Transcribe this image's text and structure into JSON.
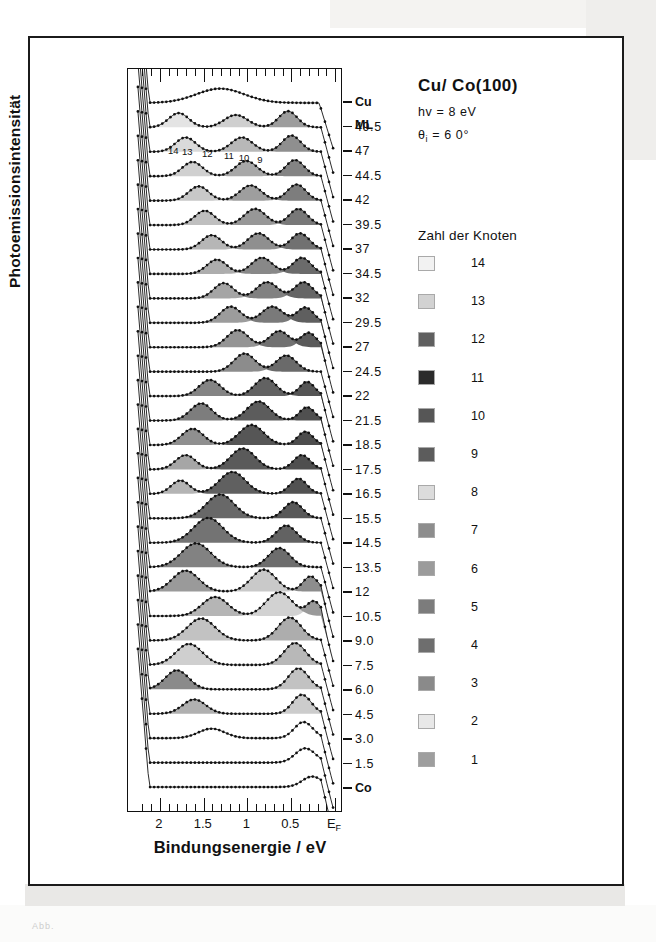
{
  "figure": {
    "header": {
      "title": "Cu/ Co(100)",
      "photon_energy": "hv = 8 eV",
      "angle": "θi = 6 0°",
      "angle_symbol": "θ",
      "angle_sub": "i",
      "angle_value": "= 6 0°"
    },
    "legend": {
      "title": "Zahl der Knoten",
      "entries": [
        {
          "label": "14",
          "color": "#f2f2f2"
        },
        {
          "label": "13",
          "color": "#d2d2d2"
        },
        {
          "label": "12",
          "color": "#5f5f5f"
        },
        {
          "label": "11",
          "color": "#2b2b2b"
        },
        {
          "label": "10",
          "color": "#565656"
        },
        {
          "label": "9",
          "color": "#5c5c5c"
        },
        {
          "label": "8",
          "color": "#dcdcdc"
        },
        {
          "label": "7",
          "color": "#8d8d8d"
        },
        {
          "label": "6",
          "color": "#9b9b9b"
        },
        {
          "label": "5",
          "color": "#7c7c7c"
        },
        {
          "label": "4",
          "color": "#6e6e6e"
        },
        {
          "label": "3",
          "color": "#8a8a8a"
        },
        {
          "label": "2",
          "color": "#e8e8e8"
        },
        {
          "label": "1",
          "color": "#9e9e9e"
        }
      ]
    },
    "axes": {
      "x_caption": "Bindungsenergie / eV",
      "y_caption": "Photoemissionsintensität",
      "x_ticklabels": [
        "2",
        "1.5",
        "1",
        "0.5",
        "E"
      ],
      "x_fermi_sub": "F",
      "x_range_ev": [
        2.25,
        0.0
      ],
      "x_major_ticks_ev": [
        2.0,
        1.5,
        1.0,
        0.5,
        0.0
      ],
      "x_minor_step_ev": 0.1
    },
    "node_annotations": [
      {
        "label": "14",
        "x_ev": 1.84
      },
      {
        "label": "13",
        "x_ev": 1.68
      },
      {
        "label": "12",
        "x_ev": 1.45
      },
      {
        "label": "11",
        "x_ev": 1.2
      },
      {
        "label": "10",
        "x_ev": 1.03
      },
      {
        "label": "9",
        "x_ev": 0.82
      }
    ]
  },
  "chart_data": {
    "type": "line",
    "title": "Cu/ Co(100)",
    "xlabel": "Bindungsenergie / eV",
    "ylabel": "Photoemissionsintensität",
    "xlim": [
      2.25,
      0.0
    ],
    "grid": false,
    "legend_position": "right",
    "x_ticklabels": [
      "2",
      "1.5",
      "1",
      "0.5",
      "EF"
    ],
    "trace_labels_top_to_bottom": [
      "Cu",
      "ML",
      "49.5",
      "47",
      "44.5",
      "42",
      "39.5",
      "37",
      "34.5",
      "32",
      "29.5",
      "27",
      "24.5",
      "22",
      "21.5",
      "18.5",
      "17.5",
      "16.5",
      "15.5",
      "14.5",
      "13.5",
      "12",
      "10.5",
      "9.0",
      "7.5",
      "6.0",
      "4.5",
      "3.0",
      "1.5",
      "Co"
    ],
    "traces": [
      {
        "label": "Cu",
        "coverage_ml": null,
        "bold": true,
        "peaks": [
          {
            "x_ev": 1.3,
            "amp": 0.3,
            "w": 0.62,
            "shade": null
          }
        ],
        "edge_ev": 0.16,
        "plateau": 0.3
      },
      {
        "label": "49.5",
        "coverage_ml": 49.5,
        "peaks": [
          {
            "x_ev": 1.78,
            "amp": 0.3,
            "w": 0.26,
            "shade": "#e4e4e4"
          },
          {
            "x_ev": 1.12,
            "amp": 0.26,
            "w": 0.3,
            "shade": "#cfcfcf"
          },
          {
            "x_ev": 0.52,
            "amp": 0.34,
            "w": 0.24,
            "shade": "#9d9d9d"
          }
        ],
        "edge_ev": 0.14
      },
      {
        "label": "47",
        "coverage_ml": 47,
        "peaks": [
          {
            "x_ev": 1.7,
            "amp": 0.3,
            "w": 0.26,
            "shade": "#dadada"
          },
          {
            "x_ev": 1.05,
            "amp": 0.3,
            "w": 0.28,
            "shade": "#b8b8b8"
          },
          {
            "x_ev": 0.48,
            "amp": 0.34,
            "w": 0.24,
            "shade": "#8f8f8f"
          }
        ],
        "edge_ev": 0.14
      },
      {
        "label": "44.5",
        "coverage_ml": 44.5,
        "peaks": [
          {
            "x_ev": 1.62,
            "amp": 0.3,
            "w": 0.26,
            "shade": "#d0d0d0"
          },
          {
            "x_ev": 1.0,
            "amp": 0.32,
            "w": 0.28,
            "shade": "#a8a8a8"
          },
          {
            "x_ev": 0.44,
            "amp": 0.34,
            "w": 0.24,
            "shade": "#848484"
          }
        ],
        "edge_ev": 0.14
      },
      {
        "label": "42",
        "coverage_ml": 42,
        "peaks": [
          {
            "x_ev": 1.55,
            "amp": 0.3,
            "w": 0.26,
            "shade": "#c8c8c8"
          },
          {
            "x_ev": 0.95,
            "amp": 0.32,
            "w": 0.28,
            "shade": "#9e9e9e"
          },
          {
            "x_ev": 0.42,
            "amp": 0.34,
            "w": 0.24,
            "shade": "#7d7d7d"
          }
        ],
        "edge_ev": 0.14
      },
      {
        "label": "39.5",
        "coverage_ml": 39.5,
        "peaks": [
          {
            "x_ev": 1.48,
            "amp": 0.3,
            "w": 0.26,
            "shade": "#bfbfbf"
          },
          {
            "x_ev": 0.9,
            "amp": 0.34,
            "w": 0.28,
            "shade": "#979797"
          },
          {
            "x_ev": 0.4,
            "amp": 0.34,
            "w": 0.24,
            "shade": "#787878"
          }
        ],
        "edge_ev": 0.14
      },
      {
        "label": "37",
        "coverage_ml": 37,
        "peaks": [
          {
            "x_ev": 1.4,
            "amp": 0.3,
            "w": 0.26,
            "shade": "#b6b6b6"
          },
          {
            "x_ev": 0.86,
            "amp": 0.34,
            "w": 0.28,
            "shade": "#8f8f8f"
          },
          {
            "x_ev": 0.38,
            "amp": 0.34,
            "w": 0.24,
            "shade": "#717171"
          }
        ],
        "edge_ev": 0.14
      },
      {
        "label": "34.5",
        "coverage_ml": 34.5,
        "peaks": [
          {
            "x_ev": 1.34,
            "amp": 0.3,
            "w": 0.26,
            "shade": "#adadad"
          },
          {
            "x_ev": 0.82,
            "amp": 0.34,
            "w": 0.28,
            "shade": "#888888"
          },
          {
            "x_ev": 0.36,
            "amp": 0.34,
            "w": 0.24,
            "shade": "#6b6b6b"
          }
        ],
        "edge_ev": 0.14
      },
      {
        "label": "32",
        "coverage_ml": 32,
        "peaks": [
          {
            "x_ev": 1.26,
            "amp": 0.32,
            "w": 0.26,
            "shade": "#a5a5a5"
          },
          {
            "x_ev": 0.76,
            "amp": 0.34,
            "w": 0.28,
            "shade": "#818181"
          },
          {
            "x_ev": 0.34,
            "amp": 0.34,
            "w": 0.24,
            "shade": "#656565"
          }
        ],
        "edge_ev": 0.14
      },
      {
        "label": "29.5",
        "coverage_ml": 29.5,
        "peaks": [
          {
            "x_ev": 1.18,
            "amp": 0.34,
            "w": 0.27,
            "shade": "#9c9c9c"
          },
          {
            "x_ev": 0.7,
            "amp": 0.34,
            "w": 0.28,
            "shade": "#7a7a7a"
          },
          {
            "x_ev": 0.32,
            "amp": 0.32,
            "w": 0.22,
            "shade": "#5f5f5f"
          }
        ],
        "edge_ev": 0.14
      },
      {
        "label": "27",
        "coverage_ml": 27,
        "peaks": [
          {
            "x_ev": 1.1,
            "amp": 0.36,
            "w": 0.28,
            "shade": "#949494"
          },
          {
            "x_ev": 0.62,
            "amp": 0.34,
            "w": 0.26,
            "shade": "#717171"
          },
          {
            "x_ev": 0.28,
            "amp": 0.3,
            "w": 0.2,
            "shade": "#5a5a5a"
          }
        ],
        "edge_ev": 0.14
      },
      {
        "label": "24.5",
        "coverage_ml": 24.5,
        "peaks": [
          {
            "x_ev": 1.02,
            "amp": 0.38,
            "w": 0.28,
            "shade": "#8c8c8c"
          },
          {
            "x_ev": 0.54,
            "amp": 0.34,
            "w": 0.26,
            "shade": "#6a6a6a"
          }
        ],
        "edge_ev": 0.14
      },
      {
        "label": "22",
        "coverage_ml": 22,
        "peaks": [
          {
            "x_ev": 1.42,
            "amp": 0.34,
            "w": 0.28,
            "shade": "#848484"
          },
          {
            "x_ev": 0.78,
            "amp": 0.38,
            "w": 0.28,
            "shade": "#626262"
          },
          {
            "x_ev": 0.3,
            "amp": 0.3,
            "w": 0.2,
            "shade": "#555555"
          }
        ],
        "edge_ev": 0.14
      },
      {
        "label": "21.5",
        "coverage_ml": 21.5,
        "peaks": [
          {
            "x_ev": 1.52,
            "amp": 0.36,
            "w": 0.28,
            "shade": "#7d7d7d"
          },
          {
            "x_ev": 0.86,
            "amp": 0.4,
            "w": 0.3,
            "shade": "#5c5c5c"
          },
          {
            "x_ev": 0.3,
            "amp": 0.28,
            "w": 0.2,
            "shade": "#505050"
          }
        ],
        "edge_ev": 0.14
      },
      {
        "label": "18.5",
        "coverage_ml": 18.5,
        "peaks": [
          {
            "x_ev": 1.62,
            "amp": 0.34,
            "w": 0.28,
            "shade": "#8f8f8f"
          },
          {
            "x_ev": 0.94,
            "amp": 0.42,
            "w": 0.32,
            "shade": "#565656"
          },
          {
            "x_ev": 0.32,
            "amp": 0.28,
            "w": 0.2,
            "shade": "#4d4d4d"
          }
        ],
        "edge_ev": 0.14
      },
      {
        "label": "17.5",
        "coverage_ml": 17.5,
        "peaks": [
          {
            "x_ev": 1.7,
            "amp": 0.3,
            "w": 0.26,
            "shade": "#a6a6a6"
          },
          {
            "x_ev": 1.04,
            "amp": 0.44,
            "w": 0.32,
            "shade": "#5a5a5a"
          },
          {
            "x_ev": 0.36,
            "amp": 0.3,
            "w": 0.22,
            "shade": "#4f4f4f"
          }
        ],
        "edge_ev": 0.14
      },
      {
        "label": "16.5",
        "coverage_ml": 16.5,
        "peaks": [
          {
            "x_ev": 1.76,
            "amp": 0.28,
            "w": 0.24,
            "shade": "#b4b4b4"
          },
          {
            "x_ev": 1.16,
            "amp": 0.46,
            "w": 0.34,
            "shade": "#606060"
          },
          {
            "x_ev": 0.4,
            "amp": 0.32,
            "w": 0.22,
            "shade": "#525252"
          }
        ],
        "edge_ev": 0.14
      },
      {
        "label": "15.5",
        "coverage_ml": 15.5,
        "peaks": [
          {
            "x_ev": 1.3,
            "amp": 0.5,
            "w": 0.36,
            "shade": "#686868"
          },
          {
            "x_ev": 0.46,
            "amp": 0.34,
            "w": 0.24,
            "shade": "#585858"
          }
        ],
        "edge_ev": 0.14
      },
      {
        "label": "14.5",
        "coverage_ml": 14.5,
        "peaks": [
          {
            "x_ev": 1.44,
            "amp": 0.52,
            "w": 0.38,
            "shade": "#737373"
          },
          {
            "x_ev": 0.54,
            "amp": 0.36,
            "w": 0.26,
            "shade": "#626262"
          }
        ],
        "edge_ev": 0.14
      },
      {
        "label": "13.5",
        "coverage_ml": 13.5,
        "peaks": [
          {
            "x_ev": 1.58,
            "amp": 0.5,
            "w": 0.38,
            "shade": "#828282"
          },
          {
            "x_ev": 0.62,
            "amp": 0.4,
            "w": 0.28,
            "shade": "#6d6d6d"
          }
        ],
        "edge_ev": 0.14
      },
      {
        "label": "12",
        "coverage_ml": 12,
        "peaks": [
          {
            "x_ev": 1.7,
            "amp": 0.44,
            "w": 0.34,
            "shade": "#9a9a9a"
          },
          {
            "x_ev": 0.8,
            "amp": 0.46,
            "w": 0.32,
            "shade": "#c9c9c9"
          },
          {
            "x_ev": 0.26,
            "amp": 0.32,
            "w": 0.2,
            "shade": "#8d8d8d"
          }
        ],
        "edge_ev": 0.14
      },
      {
        "label": "10.5",
        "coverage_ml": 10.5,
        "peaks": [
          {
            "x_ev": 1.36,
            "amp": 0.4,
            "w": 0.34,
            "shade": "#b5b5b5"
          },
          {
            "x_ev": 0.62,
            "amp": 0.5,
            "w": 0.34,
            "shade": "#d2d2d2"
          },
          {
            "x_ev": 0.22,
            "amp": 0.3,
            "w": 0.18,
            "shade": "#9a9a9a"
          }
        ],
        "edge_ev": 0.14
      },
      {
        "label": "9.0",
        "coverage_ml": 9.0,
        "peaks": [
          {
            "x_ev": 1.52,
            "amp": 0.46,
            "w": 0.36,
            "shade": "#c2c2c2"
          },
          {
            "x_ev": 0.5,
            "amp": 0.48,
            "w": 0.3,
            "shade": "#adadad"
          }
        ],
        "edge_ev": 0.14
      },
      {
        "label": "7.5",
        "coverage_ml": 7.5,
        "peaks": [
          {
            "x_ev": 1.66,
            "amp": 0.44,
            "w": 0.34,
            "shade": "#cfcfcf"
          },
          {
            "x_ev": 0.44,
            "amp": 0.46,
            "w": 0.28,
            "shade": "#b8b8b8"
          }
        ],
        "edge_ev": 0.14
      },
      {
        "label": "6.0",
        "coverage_ml": 6.0,
        "peaks": [
          {
            "x_ev": 1.8,
            "amp": 0.4,
            "w": 0.3,
            "shade": "#8a8a8a"
          },
          {
            "x_ev": 0.4,
            "amp": 0.44,
            "w": 0.26,
            "shade": "#c2c2c2"
          }
        ],
        "edge_ev": 0.14
      },
      {
        "label": "4.5",
        "coverage_ml": 4.5,
        "peaks": [
          {
            "x_ev": 1.6,
            "amp": 0.3,
            "w": 0.3,
            "shade": "#b0b0b0"
          },
          {
            "x_ev": 0.36,
            "amp": 0.4,
            "w": 0.24,
            "shade": "#cccccc"
          }
        ],
        "edge_ev": 0.14
      },
      {
        "label": "3.0",
        "coverage_ml": 3.0,
        "peaks": [
          {
            "x_ev": 1.4,
            "amp": 0.2,
            "w": 0.34,
            "shade": null
          },
          {
            "x_ev": 0.34,
            "amp": 0.34,
            "w": 0.24,
            "shade": null
          }
        ],
        "edge_ev": 0.14
      },
      {
        "label": "1.5",
        "coverage_ml": 1.5,
        "peaks": [
          {
            "x_ev": 0.32,
            "amp": 0.3,
            "w": 0.26,
            "shade": null
          }
        ],
        "edge_ev": 0.14
      },
      {
        "label": "Co",
        "coverage_ml": 0,
        "bold": true,
        "peaks": [
          {
            "x_ev": 0.24,
            "amp": 0.22,
            "w": 0.26,
            "shade": null
          }
        ],
        "edge_ev": 0.14
      }
    ]
  }
}
